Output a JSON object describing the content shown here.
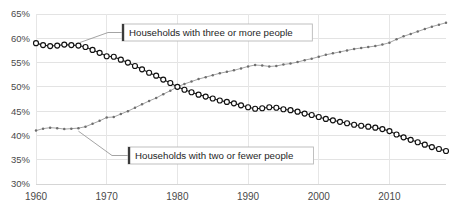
{
  "chart_data": {
    "type": "line",
    "title": "",
    "subtitle": "",
    "xlabel": "",
    "ylabel": "",
    "xlim": [
      1960,
      2018
    ],
    "ylim": [
      30,
      65
    ],
    "y_tick_labels": [
      "65%",
      "60%",
      "55%",
      "50%",
      "45%",
      "40%",
      "35%",
      "30%"
    ],
    "y_tick_values": [
      65,
      60,
      55,
      50,
      45,
      40,
      35,
      30
    ],
    "x_tick_labels": [
      "1960",
      "1970",
      "1980",
      "1990",
      "2000",
      "2010"
    ],
    "x_tick_values": [
      1960,
      1970,
      1980,
      1990,
      2000,
      2010
    ],
    "grid": "horizontal-and-vertical",
    "legend_position": "inline-callout-labels",
    "x": [
      1960,
      1961,
      1962,
      1963,
      1964,
      1965,
      1966,
      1967,
      1968,
      1969,
      1970,
      1971,
      1972,
      1973,
      1974,
      1975,
      1976,
      1977,
      1978,
      1979,
      1980,
      1981,
      1982,
      1983,
      1984,
      1985,
      1986,
      1987,
      1988,
      1989,
      1990,
      1991,
      1992,
      1993,
      1994,
      1995,
      1996,
      1997,
      1998,
      1999,
      2000,
      2001,
      2002,
      2003,
      2004,
      2005,
      2006,
      2007,
      2008,
      2009,
      2010,
      2011,
      2012,
      2013,
      2014,
      2015,
      2016,
      2017,
      2018
    ],
    "series": [
      {
        "name": "Households with three or more people",
        "marker": "open-circle",
        "line_style": "solid",
        "color": "#111111",
        "values": [
          59.0,
          58.6,
          58.4,
          58.5,
          58.7,
          58.6,
          58.5,
          58.2,
          57.6,
          57.0,
          56.3,
          56.2,
          55.6,
          55.0,
          54.3,
          53.6,
          52.9,
          52.3,
          51.5,
          50.8,
          50.0,
          49.4,
          48.9,
          48.4,
          48.0,
          47.6,
          47.2,
          46.9,
          46.6,
          46.2,
          45.8,
          45.5,
          45.6,
          45.8,
          45.7,
          45.4,
          45.2,
          44.9,
          44.5,
          44.2,
          43.8,
          43.4,
          43.1,
          42.8,
          42.5,
          42.2,
          42.0,
          41.8,
          41.6,
          41.3,
          40.9,
          40.2,
          39.6,
          39.1,
          38.6,
          38.1,
          37.6,
          37.2,
          36.8
        ]
      },
      {
        "name": "Households with two or fewer people",
        "marker": "small-dot",
        "line_style": "dotted",
        "color": "#6e6e6e",
        "values": [
          41.0,
          41.4,
          41.6,
          41.5,
          41.3,
          41.4,
          41.5,
          41.8,
          42.4,
          43.0,
          43.7,
          43.8,
          44.4,
          45.0,
          45.7,
          46.4,
          47.1,
          47.7,
          48.5,
          49.2,
          50.0,
          50.6,
          51.1,
          51.6,
          52.0,
          52.4,
          52.8,
          53.1,
          53.4,
          53.8,
          54.2,
          54.5,
          54.4,
          54.2,
          54.3,
          54.6,
          54.8,
          55.1,
          55.5,
          55.8,
          56.2,
          56.6,
          56.9,
          57.2,
          57.5,
          57.8,
          58.0,
          58.2,
          58.4,
          58.7,
          59.1,
          59.8,
          60.4,
          60.9,
          61.4,
          61.9,
          62.4,
          62.8,
          63.2
        ]
      }
    ],
    "annotations": [
      {
        "id": "label-three-or-more",
        "text": "Households with three or more people",
        "points_to_series": "Households with three or more people"
      },
      {
        "id": "label-two-or-fewer",
        "text": "Households with two or fewer people",
        "points_to_series": "Households with two or fewer people"
      }
    ]
  }
}
